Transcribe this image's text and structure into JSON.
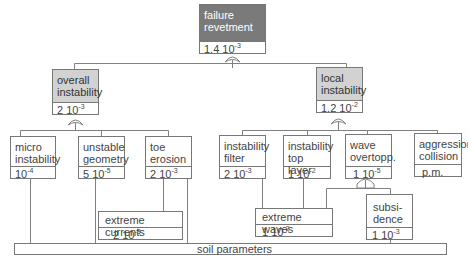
{
  "diagram": {
    "type": "fault-tree",
    "top_event": {
      "label": "failure revetment",
      "mantissa": "1.4",
      "base": "10",
      "exponent": "-3"
    },
    "intermediate_events": [
      {
        "id": "overall",
        "label": "overall instability",
        "mantissa": "2",
        "base": "10",
        "exponent": "-3",
        "gate": "or"
      },
      {
        "id": "local",
        "label": "local instability",
        "mantissa": "1.2",
        "base": "10",
        "exponent": "-2",
        "gate": "or"
      }
    ],
    "overall_children": [
      {
        "label": "micro instability",
        "mantissa": "",
        "base": "10",
        "exponent": "-4"
      },
      {
        "label": "unstable geometry",
        "mantissa": "5",
        "base": "10",
        "exponent": "-5"
      },
      {
        "label": "toe erosion",
        "mantissa": "2",
        "base": "10",
        "exponent": "-3"
      }
    ],
    "local_children": [
      {
        "label": "instability filter",
        "mantissa": "2",
        "base": "10",
        "exponent": "-3"
      },
      {
        "label": "instability top layer",
        "mantissa": "1",
        "base": "10",
        "exponent": "-2"
      },
      {
        "label": "wave overtopp.",
        "mantissa": "1",
        "base": "10",
        "exponent": "-5",
        "gate": "and"
      },
      {
        "label": "aggression collision",
        "value": "p.m."
      }
    ],
    "basic_events": [
      {
        "label": "extreme currents",
        "mantissa": "2",
        "base": "10",
        "exponent": "-3"
      },
      {
        "label": "extreme waves",
        "mantissa": "1",
        "base": "10",
        "exponent": "-2"
      },
      {
        "label": "subsi-dence",
        "line1": "subsi-",
        "line2": "dence",
        "mantissa": "1",
        "base": "10",
        "exponent": "-3"
      }
    ],
    "shared_cause": {
      "label": "soil parameters"
    },
    "colors": {
      "top_fill": "#7a7a7a",
      "intermediate_fill": "#d2d2d2",
      "line": "#777777",
      "text": "#444444"
    }
  }
}
